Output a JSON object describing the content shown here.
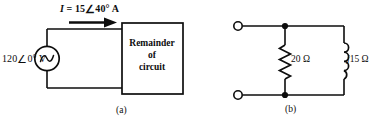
{
  "figure": {
    "caption_a": "(a)",
    "caption_b": "(b)"
  },
  "circuit_a": {
    "current_label": "I = 15 ∠40° A",
    "current_symbol": "I",
    "current_value": "15",
    "current_angle": "40°",
    "current_unit": "A",
    "source_label": "120 ∠0° V",
    "source_value": "120",
    "source_angle": "0°",
    "source_unit": "V",
    "source_type": "ac-voltage-source",
    "box_line1": "Remainder",
    "box_line2": "of",
    "box_line3": "circuit",
    "arrow_direction": "right"
  },
  "circuit_b": {
    "resistor_label": "20 Ω",
    "resistor_value": "20",
    "resistor_unit": "Ω",
    "inductor_label": "j15 Ω",
    "inductor_prefix": "j",
    "inductor_value": "15",
    "inductor_unit": "Ω",
    "terminal_top": "open-terminal",
    "terminal_bottom": "open-terminal"
  },
  "style": {
    "line_color": "#0d0d0d",
    "background": "#ffffff"
  }
}
